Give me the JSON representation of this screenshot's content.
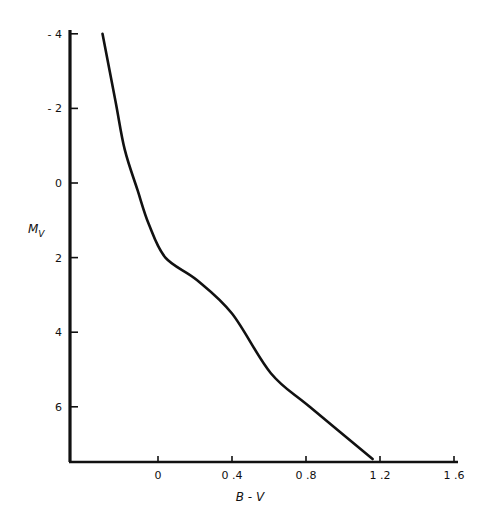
{
  "chart_data": {
    "type": "line",
    "title": "",
    "xlabel": "B - V",
    "ylabel": "M_V",
    "ylabel_main": "M",
    "ylabel_sub": "V",
    "xlim": [
      -0.48,
      1.62
    ],
    "ylim": [
      7.6,
      -4.3
    ],
    "y_inverted": true,
    "grid": false,
    "legend": null,
    "x_ticks": [
      0,
      0.4,
      0.8,
      1.2,
      1.6
    ],
    "x_tick_labels": [
      "0",
      "0.4",
      "0.8",
      "1.2",
      "1.6"
    ],
    "y_ticks": [
      -4,
      -2,
      0,
      2,
      4,
      6
    ],
    "y_tick_labels": [
      "-4",
      "-2",
      "0",
      "2",
      "4",
      "6"
    ],
    "series": [
      {
        "name": "Main sequence",
        "color": "#111111",
        "x": [
          -0.3,
          -0.23,
          -0.18,
          -0.11,
          -0.05,
          0.04,
          0.21,
          0.4,
          0.61,
          0.82,
          1.16
        ],
        "y": [
          -4.0,
          -2.2,
          -0.9,
          0.2,
          1.1,
          2.0,
          2.6,
          3.5,
          5.1,
          6.0,
          7.4
        ]
      }
    ]
  }
}
